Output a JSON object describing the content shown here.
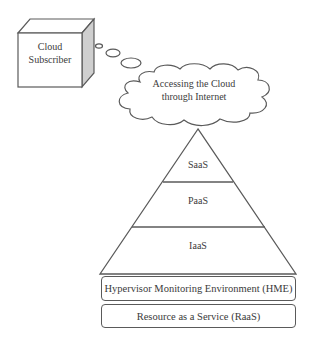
{
  "diagram": {
    "subscriber": {
      "line1": "Cloud",
      "line2": "Subscriber"
    },
    "cloud": {
      "line1": "Accessing the Cloud",
      "line2": "through Internet"
    },
    "pyramid": {
      "layers": [
        {
          "label": "SaaS"
        },
        {
          "label": "PaaS"
        },
        {
          "label": "IaaS"
        }
      ]
    },
    "base_boxes": [
      {
        "label": "Hypervisor Monitoring Environment (HME)"
      },
      {
        "label": "Resource as a Service (RaaS)"
      }
    ],
    "colors": {
      "stroke": "#5a5a5a",
      "cube_side": "#cfcfcf",
      "text": "#3c3c3c",
      "background": "#ffffff"
    }
  }
}
